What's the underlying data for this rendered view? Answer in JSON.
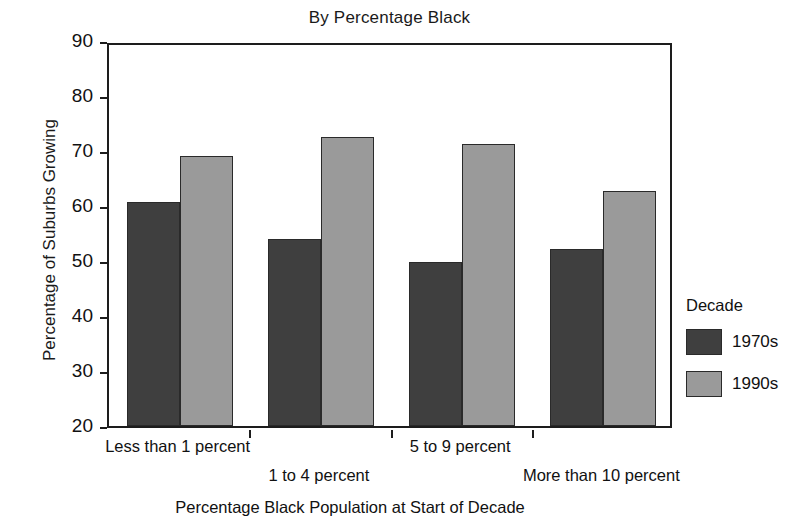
{
  "chart_data": {
    "type": "bar",
    "title": "By Percentage Black",
    "xlabel": "Percentage Black Population at Start of Decade",
    "ylabel": "Percentage of Suburbs Growing",
    "categories": [
      "Less than 1 percent",
      "1 to 4 percent",
      "5 to 9 percent",
      "More than 10 percent"
    ],
    "series": [
      {
        "name": "1970s",
        "color": "#3f3f3f",
        "values": [
          60.8,
          54.0,
          49.9,
          52.2
        ]
      },
      {
        "name": "1990s",
        "color": "#9a9a9a",
        "values": [
          69.1,
          72.5,
          71.2,
          62.8
        ]
      }
    ],
    "ylim": [
      20,
      90
    ],
    "yticks": [
      20,
      30,
      40,
      50,
      60,
      70,
      80,
      90
    ],
    "ytick_labels": [
      "20",
      "30",
      "40",
      "50",
      "60",
      "70",
      "80",
      "90"
    ],
    "grid": false,
    "legend_position": "right",
    "legend_title": "Decade"
  },
  "legend": {
    "title": "Decade",
    "entries": [
      {
        "label": "1970s",
        "swatch": "s1970"
      },
      {
        "label": "1990s",
        "swatch": "s1990"
      }
    ]
  }
}
